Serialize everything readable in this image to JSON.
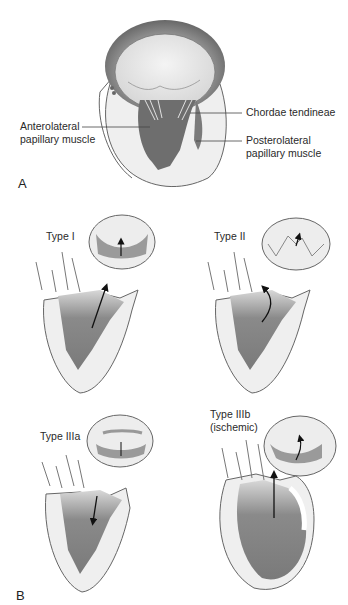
{
  "figure": {
    "panel_a": {
      "letter": "A",
      "labels": {
        "chordae": "Chordae tendineae",
        "anterolateral_line1": "Anterolateral",
        "anterolateral_line2": "papillary muscle",
        "posterolateral_line1": "Posterolateral",
        "posterolateral_line2": "papillary muscle"
      }
    },
    "panel_b": {
      "letter": "B",
      "types": [
        {
          "label": "Type I",
          "motion": "normal leaflet motion"
        },
        {
          "label": "Type II",
          "motion": "excessive leaflet motion"
        },
        {
          "label": "Type IIIa",
          "motion": "restricted leaflet motion"
        },
        {
          "label_line1": "Type IIIb",
          "label_line2": "(ischemic)",
          "motion": "restricted leaflet motion"
        }
      ]
    },
    "colors": {
      "muscle_dark": "#6e6e6e",
      "muscle_mid": "#8a8a8a",
      "wall_light": "#ececec",
      "outline": "#555555",
      "valve_light": "#e6e6e6",
      "annulus_dark": "#5a5a5a"
    }
  }
}
